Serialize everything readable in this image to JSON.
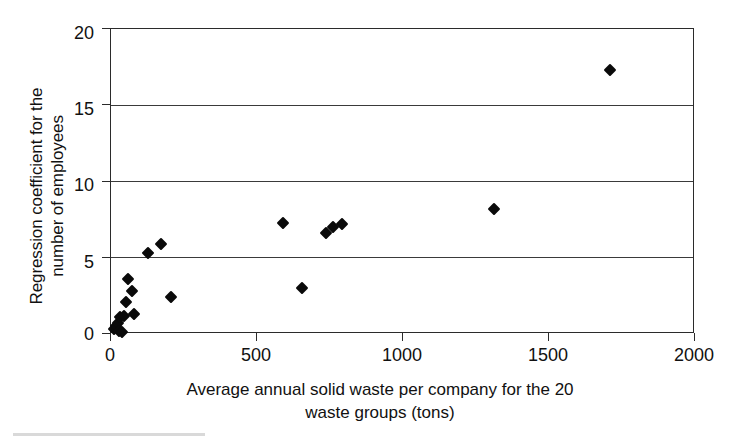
{
  "chart_data": {
    "type": "scatter",
    "title": "",
    "xlabel": "Average annual solid waste per company for the  20\nwaste groups (tons)",
    "ylabel": "Regression coefficient for the\nnumber of employees",
    "xlim": [
      0,
      2000
    ],
    "ylim": [
      0,
      20
    ],
    "xticks": [
      0,
      500,
      1000,
      1500,
      2000
    ],
    "xtick_labels": [
      "0",
      "500",
      "1000",
      "1500",
      "2000"
    ],
    "yticks": [
      0,
      5,
      10,
      15,
      20
    ],
    "ytick_labels": [
      "0",
      "5",
      "10",
      "15",
      "20"
    ],
    "grid": "horizontal",
    "legend": "none",
    "marker": "filled-diamond",
    "marker_color": "#0a0a0a",
    "series": [
      {
        "name": "waste groups",
        "points": [
          {
            "x": 10,
            "y": 0.3
          },
          {
            "x": 17,
            "y": 0.5
          },
          {
            "x": 24,
            "y": 0.7
          },
          {
            "x": 28,
            "y": 0.2
          },
          {
            "x": 31,
            "y": 1.1
          },
          {
            "x": 38,
            "y": 0.1
          },
          {
            "x": 44,
            "y": 1.2
          },
          {
            "x": 52,
            "y": 2.1
          },
          {
            "x": 58,
            "y": 3.6
          },
          {
            "x": 72,
            "y": 2.8
          },
          {
            "x": 78,
            "y": 1.3
          },
          {
            "x": 128,
            "y": 5.3
          },
          {
            "x": 172,
            "y": 5.9
          },
          {
            "x": 205,
            "y": 2.4
          },
          {
            "x": 590,
            "y": 7.3
          },
          {
            "x": 655,
            "y": 3.0
          },
          {
            "x": 735,
            "y": 6.6
          },
          {
            "x": 760,
            "y": 7.0
          },
          {
            "x": 790,
            "y": 7.2
          },
          {
            "x": 1310,
            "y": 8.2
          },
          {
            "x": 1710,
            "y": 17.3
          }
        ]
      }
    ]
  }
}
